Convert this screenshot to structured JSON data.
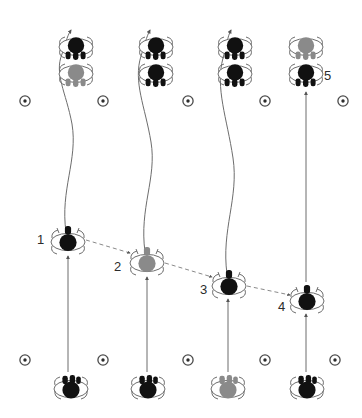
{
  "figure": {
    "title": "",
    "type": "insect-movement-diagram",
    "background_color": "#ffffff",
    "stroke_color": "#555555",
    "body_dark_color": "#111111",
    "body_gray_color": "#8a8a8a",
    "label_color": "#2b2b2b",
    "width": 362,
    "height": 418
  },
  "labels": [
    {
      "id": "label-1",
      "text": "1",
      "x": 37,
      "y": 233
    },
    {
      "id": "label-2",
      "text": "2",
      "x": 114,
      "y": 260
    },
    {
      "id": "label-3",
      "text": "3",
      "x": 200,
      "y": 283
    },
    {
      "id": "label-4",
      "text": "4",
      "x": 278,
      "y": 300
    },
    {
      "id": "label-5",
      "text": "5",
      "x": 324,
      "y": 69
    }
  ],
  "nest_markers": {
    "icon": "circle-dot-marker",
    "top_row_y": 101,
    "bottom_row_y": 360,
    "x_positions": [
      25,
      103,
      188,
      265,
      343
    ],
    "bottom_x_positions": [
      25,
      103,
      188,
      265,
      335
    ]
  },
  "bottom_insects": [
    {
      "id": "bottom-insect-1",
      "x": 71,
      "y": 389,
      "color": "dark",
      "orientation": "down"
    },
    {
      "id": "bottom-insect-2",
      "x": 148,
      "y": 389,
      "color": "dark",
      "orientation": "down"
    },
    {
      "id": "bottom-insect-3",
      "x": 228,
      "y": 389,
      "color": "gray",
      "orientation": "down"
    },
    {
      "id": "bottom-insect-4",
      "x": 307,
      "y": 389,
      "color": "dark",
      "orientation": "down"
    }
  ],
  "middle_insects": [
    {
      "id": "middle-insect-1",
      "x": 68,
      "y": 241,
      "color": "dark",
      "orientation": "up",
      "label": "1"
    },
    {
      "id": "middle-insect-2",
      "x": 147,
      "y": 262,
      "color": "gray",
      "orientation": "up",
      "label": "2"
    },
    {
      "id": "middle-insect-3",
      "x": 229,
      "y": 285,
      "color": "dark",
      "orientation": "up",
      "label": "3"
    },
    {
      "id": "middle-insect-4",
      "x": 307,
      "y": 300,
      "color": "dark",
      "orientation": "up",
      "label": "4"
    }
  ],
  "top_clusters": [
    {
      "id": "top-cluster-1",
      "x": 76,
      "upper": {
        "y": 47,
        "color": "dark"
      },
      "lower": {
        "y": 74,
        "color": "gray"
      }
    },
    {
      "id": "top-cluster-2",
      "x": 156,
      "upper": {
        "y": 47,
        "color": "dark"
      },
      "lower": {
        "y": 74,
        "color": "dark"
      }
    },
    {
      "id": "top-cluster-3",
      "x": 235,
      "upper": {
        "y": 47,
        "color": "dark"
      },
      "lower": {
        "y": 74,
        "color": "dark"
      }
    },
    {
      "id": "top-cluster-4",
      "x": 306,
      "upper": {
        "y": 47,
        "color": "gray"
      },
      "lower": {
        "y": 74,
        "color": "dark"
      }
    }
  ],
  "straight_arrows": [
    {
      "id": "up-arrow-bottom-1",
      "x": 68,
      "y1": 372,
      "y2": 255
    },
    {
      "id": "up-arrow-bottom-2",
      "x": 147,
      "y1": 372,
      "y2": 276
    },
    {
      "id": "up-arrow-bottom-3",
      "x": 228,
      "y1": 372,
      "y2": 298
    },
    {
      "id": "up-arrow-bottom-4",
      "x": 306,
      "y1": 372,
      "y2": 313
    },
    {
      "id": "up-arrow-column-5",
      "x": 306,
      "y1": 280,
      "y2": 92
    }
  ],
  "curved_arrows": [
    {
      "id": "curve-arrow-1",
      "from_x": 68,
      "from_y": 232,
      "to_x": 73,
      "to_y": 18
    },
    {
      "id": "curve-arrow-2",
      "from_x": 147,
      "from_y": 252,
      "to_x": 152,
      "to_y": 18
    },
    {
      "id": "curve-arrow-3",
      "from_x": 228,
      "from_y": 275,
      "to_x": 233,
      "to_y": 18
    }
  ],
  "dashed_arrows": [
    {
      "id": "dashed-arrow-1-2",
      "x1": 84,
      "y1": 241,
      "x2": 131,
      "y2": 254
    },
    {
      "id": "dashed-arrow-2-3",
      "x1": 163,
      "y1": 264,
      "x2": 213,
      "y2": 278
    },
    {
      "id": "dashed-arrow-3-4",
      "x1": 245,
      "y1": 287,
      "x2": 291,
      "y2": 296
    }
  ]
}
